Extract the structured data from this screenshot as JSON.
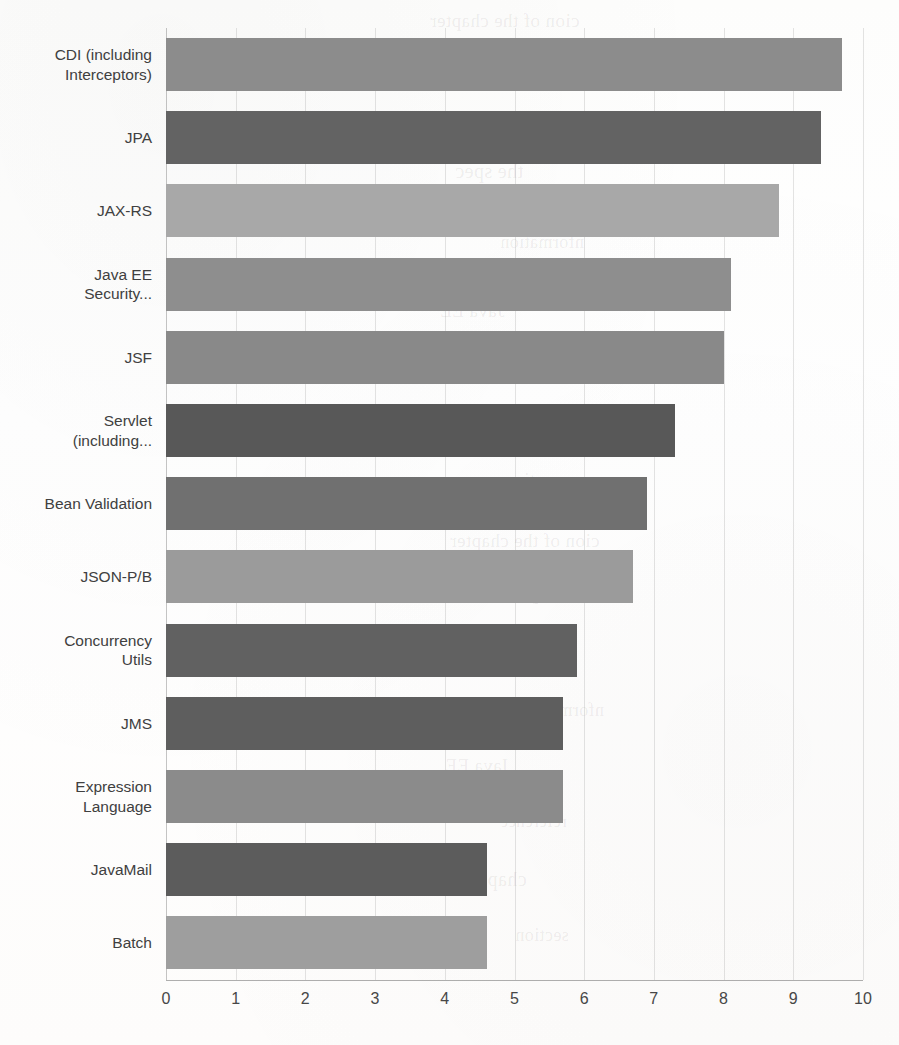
{
  "chart_data": {
    "type": "bar",
    "orientation": "horizontal",
    "title": "",
    "subtitle": "",
    "xlabel": "",
    "ylabel": "",
    "xlim": [
      0,
      10
    ],
    "xticks": [
      "0",
      "1",
      "2",
      "3",
      "4",
      "5",
      "6",
      "7",
      "8",
      "9",
      "10"
    ],
    "grid": "vertical",
    "legend": "none",
    "categories": [
      "CDI (including Interceptors)",
      "JPA",
      "JAX-RS",
      "Java EE Security...",
      "JSF",
      "Servlet (including...",
      "Bean Validation",
      "JSON-P/B",
      "Concurrency Utils",
      "JMS",
      "Expression Language",
      "JavaMail",
      "Batch"
    ],
    "values": [
      9.7,
      9.4,
      8.8,
      8.1,
      8.0,
      7.3,
      6.9,
      6.7,
      5.9,
      5.7,
      5.7,
      4.6,
      4.6
    ],
    "bars": [
      {
        "label": "CDI (including Interceptors)",
        "label_lines": [
          "CDI (including",
          "Interceptors)"
        ],
        "value": 9.7,
        "color": "#8c8c8c"
      },
      {
        "label": "JPA",
        "label_lines": [
          "JPA"
        ],
        "value": 9.4,
        "color": "#636363"
      },
      {
        "label": "JAX-RS",
        "label_lines": [
          "JAX-RS"
        ],
        "value": 8.8,
        "color": "#a8a8a8"
      },
      {
        "label": "Java EE Security...",
        "label_lines": [
          "Java EE",
          "Security..."
        ],
        "value": 8.1,
        "color": "#8e8e8e"
      },
      {
        "label": "JSF",
        "label_lines": [
          "JSF"
        ],
        "value": 8.0,
        "color": "#898989"
      },
      {
        "label": "Servlet (including...",
        "label_lines": [
          "Servlet",
          "(including..."
        ],
        "value": 7.3,
        "color": "#585858"
      },
      {
        "label": "Bean Validation",
        "label_lines": [
          "Bean Validation"
        ],
        "value": 6.9,
        "color": "#707070"
      },
      {
        "label": "JSON-P/B",
        "label_lines": [
          "JSON-P/B"
        ],
        "value": 6.7,
        "color": "#9b9b9b"
      },
      {
        "label": "Concurrency Utils",
        "label_lines": [
          "Concurrency",
          "Utils"
        ],
        "value": 5.9,
        "color": "#616161"
      },
      {
        "label": "JMS",
        "label_lines": [
          "JMS"
        ],
        "value": 5.7,
        "color": "#5e5e5e"
      },
      {
        "label": "Expression Language",
        "label_lines": [
          "Expression",
          "Language"
        ],
        "value": 5.7,
        "color": "#8b8b8b"
      },
      {
        "label": "JavaMail",
        "label_lines": [
          "JavaMail"
        ],
        "value": 4.6,
        "color": "#5c5c5c"
      },
      {
        "label": "Batch",
        "label_lines": [
          "Batch"
        ],
        "value": 4.6,
        "color": "#9e9e9e"
      }
    ]
  },
  "colors": {
    "background": "#ffffff",
    "axis": "#6e6e6e",
    "gridline": "#b4b4b4",
    "tick_text": "#474747",
    "category_text": "#404040"
  },
  "page_artifacts": {
    "show_bleed_through": true,
    "ghost_lines": [
      "cion of the chapter",
      "and through the",
      "the spec",
      "nformation",
      "Java EE",
      "reference",
      "chapter",
      "section"
    ]
  }
}
